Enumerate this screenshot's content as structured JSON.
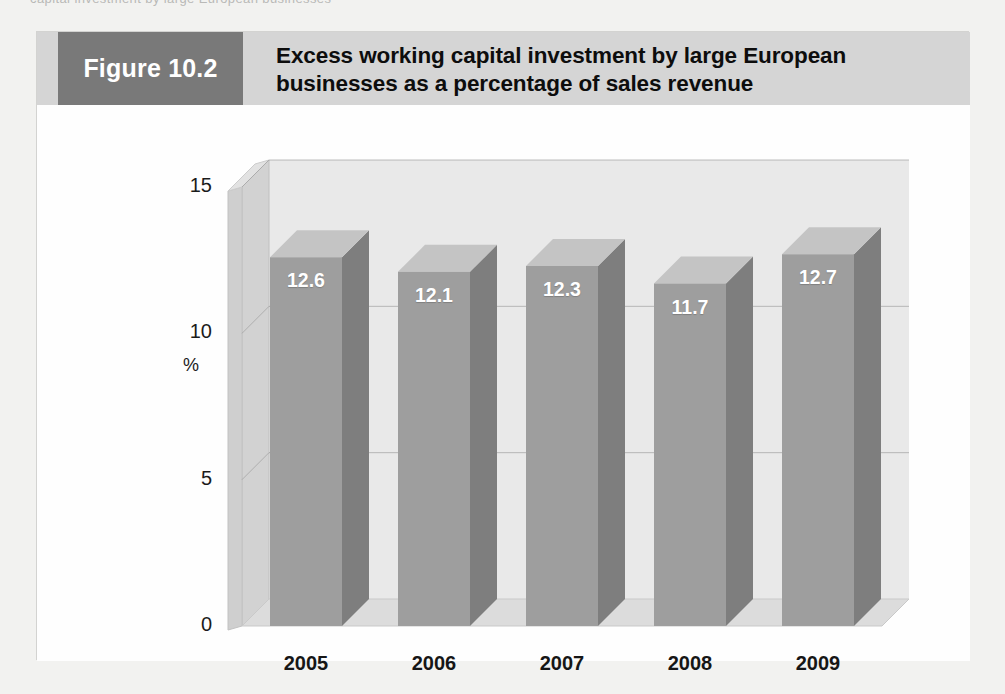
{
  "scan": {
    "top_cut_text": "capital investment by large European businesses"
  },
  "figure": {
    "number_label": "Figure 10.2",
    "title_line_1": "Excess working capital investment by large European",
    "title_line_2": "businesses as a percentage of sales revenue",
    "number_block_color": "#797979",
    "header_band_color": "#d5d5d5"
  },
  "chart_data": {
    "type": "bar",
    "title": "Excess working capital investment by large European businesses as a percentage of sales revenue",
    "subtitle": "",
    "xlabel": "",
    "ylabel": "%",
    "categories": [
      "2005",
      "2006",
      "2007",
      "2008",
      "2009"
    ],
    "values": [
      12.6,
      12.1,
      12.3,
      11.7,
      12.7
    ],
    "value_labels": [
      "12.6",
      "12.1",
      "12.3",
      "11.7",
      "12.7"
    ],
    "ylim": [
      0,
      15
    ],
    "yticks": [
      0,
      5,
      10,
      15
    ],
    "ytick_labels": [
      "0",
      "5",
      "10",
      "15"
    ],
    "grid": true,
    "grid_axis": "y",
    "legend": false,
    "legend_position": "none",
    "three_d": true,
    "bar_front_color": "#9e9e9e",
    "bar_side_color": "#7e7e7e",
    "bar_top_color": "#c4c4c4",
    "wall_color": "#e9e9e9",
    "floor_color": "#dcdcdc",
    "gridline_color": "#8d8d8d"
  }
}
